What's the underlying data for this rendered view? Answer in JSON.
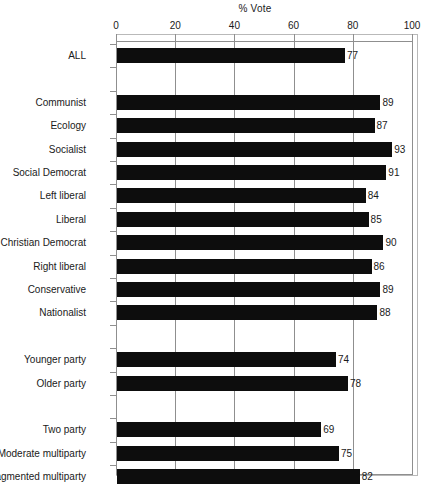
{
  "chart_data": {
    "type": "bar",
    "orientation": "horizontal",
    "title": "% Vote",
    "xlabel": "",
    "ylabel": "",
    "xlim": [
      0,
      100
    ],
    "xticks": [
      0,
      20,
      40,
      60,
      80,
      100
    ],
    "xtick_labels": [
      "0",
      "20",
      "40",
      "60",
      "80",
      "100"
    ],
    "grid": "vertical",
    "legend": "none",
    "bar_color": "#0d0d0d",
    "axis_color": "#8f8f8f",
    "value_labels": true,
    "categories": [
      "ALL",
      "Communist",
      "Ecology",
      "Socialist",
      "Social Democrat",
      "Left liberal",
      "Liberal",
      "Christian Democrat",
      "Right liberal",
      "Conservative",
      "Nationalist",
      "Younger party",
      "Older party",
      "Two party",
      "Moderate multiparty",
      "Fragmented multiparty"
    ],
    "values": [
      77,
      89,
      87,
      93,
      91,
      84,
      85,
      90,
      86,
      89,
      88,
      74,
      78,
      69,
      75,
      82
    ],
    "groups": [
      {
        "name": "overall",
        "categories": [
          "ALL"
        ]
      },
      {
        "name": "party-family",
        "categories": [
          "Communist",
          "Ecology",
          "Socialist",
          "Social Democrat",
          "Left liberal",
          "Liberal",
          "Christian Democrat",
          "Right liberal",
          "Conservative",
          "Nationalist"
        ]
      },
      {
        "name": "party-age",
        "categories": [
          "Younger party",
          "Older party"
        ]
      },
      {
        "name": "party-system",
        "categories": [
          "Two party",
          "Moderate multiparty",
          "Fragmented multiparty"
        ]
      }
    ]
  }
}
